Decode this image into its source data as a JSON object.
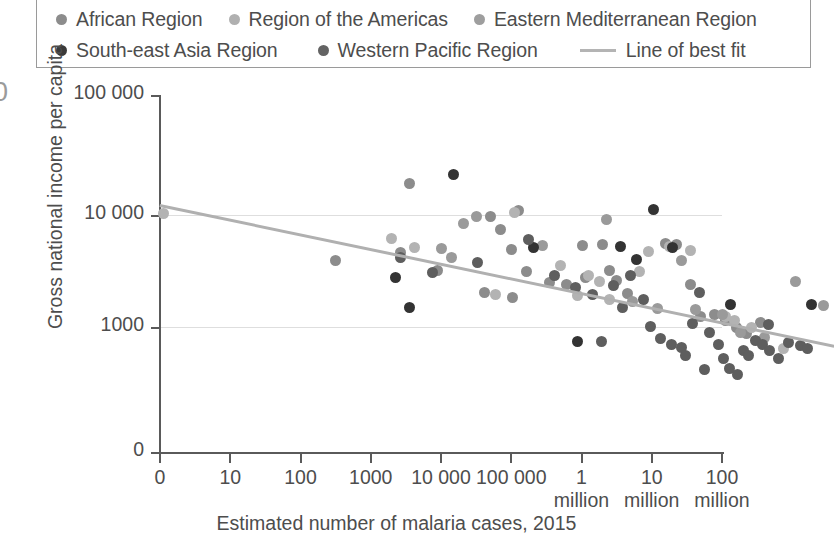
{
  "legend": {
    "rows": [
      [
        {
          "label": "African Region",
          "color": "#8c8c8c",
          "marker": "dot"
        },
        {
          "label": "Region of the Americas",
          "color": "#b0b0b0",
          "marker": "dot"
        },
        {
          "label": "Eastern Mediterranean Region",
          "color": "#9e9e9e",
          "marker": "dot"
        }
      ],
      [
        {
          "label": "South-east Asia Region",
          "color": "#3a3a3a",
          "marker": "dot"
        },
        {
          "label": "Western Pacific Region",
          "color": "#636363",
          "marker": "dot"
        },
        {
          "label": "Line of best fit",
          "color": "#b4b4b4",
          "marker": "line"
        }
      ]
    ]
  },
  "edge_glyph": "0",
  "chart_data": {
    "type": "scatter",
    "title": "",
    "xlabel": "Estimated number of malaria cases, 2015",
    "ylabel": "Gross national income per capita",
    "x_tick_labels": [
      "0",
      "10",
      "100",
      "1000",
      "10 000",
      "100 000",
      "1\nmillion",
      "10\nmillion",
      "100\nmillion"
    ],
    "y_tick_labels": [
      "100 000",
      "10 000",
      "1000",
      "0"
    ],
    "x_scale": "log-like ordinal decades",
    "y_scale": "log",
    "grid": "horizontal gridlines at 10 000 and 1000",
    "legend_position": "top",
    "xlim": [
      0,
      8
    ],
    "ylim": [
      0,
      100000
    ],
    "series": [
      {
        "name": "African Region",
        "color": "#8c8c8c",
        "points": [
          [
            2.5,
            3900
          ],
          [
            3.42,
            4600
          ],
          [
            3.55,
            19000
          ],
          [
            3.95,
            3200
          ],
          [
            4.7,
            9700
          ],
          [
            4.85,
            7400
          ],
          [
            5.1,
            11000
          ],
          [
            5.0,
            4900
          ],
          [
            5.22,
            3100
          ],
          [
            5.55,
            2500
          ],
          [
            4.62,
            2050
          ],
          [
            5.02,
            1850
          ],
          [
            6.02,
            5300
          ],
          [
            6.3,
            5450
          ],
          [
            6.4,
            3200
          ],
          [
            6.05,
            2750
          ],
          [
            6.5,
            2600
          ],
          [
            5.78,
            2400
          ],
          [
            6.65,
            2000
          ],
          [
            7.2,
            5600
          ],
          [
            7.35,
            5450
          ],
          [
            7.55,
            2400
          ],
          [
            7.7,
            1250
          ],
          [
            7.9,
            1300
          ],
          [
            8.05,
            1150
          ],
          [
            8.2,
            1000
          ],
          [
            8.35,
            880
          ],
          [
            8.55,
            1100
          ]
        ]
      },
      {
        "name": "Region of the Americas",
        "color": "#b3b3b3",
        "points": [
          [
            0.05,
            10400
          ],
          [
            5.05,
            10600
          ],
          [
            5.95,
            1900
          ],
          [
            6.4,
            1750
          ],
          [
            5.7,
            3550
          ],
          [
            6.1,
            2900
          ],
          [
            6.25,
            2550
          ],
          [
            7.25,
            5200
          ],
          [
            7.55,
            4800
          ],
          [
            6.95,
            4700
          ],
          [
            6.82,
            3100
          ],
          [
            8.05,
            1250
          ],
          [
            8.18,
            1150
          ],
          [
            8.42,
            980
          ],
          [
            8.88,
            640
          ],
          [
            4.78,
            1950
          ],
          [
            3.3,
            6200
          ],
          [
            3.62,
            5100
          ]
        ]
      },
      {
        "name": "Eastern Mediterranean Region",
        "color": "#9a9a9a",
        "points": [
          [
            4.5,
            9600
          ],
          [
            4.32,
            8400
          ],
          [
            5.45,
            5300
          ],
          [
            6.35,
            9100
          ],
          [
            6.72,
            1700
          ],
          [
            7.08,
            1450
          ],
          [
            7.42,
            3900
          ],
          [
            7.62,
            1420
          ],
          [
            8.0,
            1300
          ],
          [
            8.26,
            900
          ],
          [
            8.6,
            800
          ],
          [
            9.05,
            2550
          ],
          [
            9.45,
            1550
          ],
          [
            4.0,
            5000
          ],
          [
            4.15,
            4200
          ]
        ]
      },
      {
        "name": "South-east Asia Region",
        "color": "#333333",
        "points": [
          [
            3.35,
            2750
          ],
          [
            3.55,
            1500
          ],
          [
            4.18,
            23000
          ],
          [
            5.95,
            740
          ],
          [
            6.55,
            5200
          ],
          [
            7.02,
            11200
          ],
          [
            7.3,
            5100
          ],
          [
            8.12,
            1600
          ],
          [
            5.32,
            5100
          ],
          [
            6.78,
            4000
          ],
          [
            9.28,
            1600
          ]
        ]
      },
      {
        "name": "Western Pacific Region",
        "color": "#5e5e5e",
        "points": [
          [
            3.42,
            4150
          ],
          [
            3.88,
            3050
          ],
          [
            4.52,
            3800
          ],
          [
            5.25,
            6000
          ],
          [
            5.62,
            2900
          ],
          [
            5.92,
            2250
          ],
          [
            6.15,
            1950
          ],
          [
            6.45,
            2350
          ],
          [
            6.58,
            1480
          ],
          [
            6.88,
            1750
          ],
          [
            6.98,
            1020
          ],
          [
            7.12,
            790
          ],
          [
            7.28,
            700
          ],
          [
            7.42,
            660
          ],
          [
            7.48,
            560
          ],
          [
            7.68,
            2050
          ],
          [
            7.82,
            900
          ],
          [
            7.95,
            700
          ],
          [
            8.02,
            520
          ],
          [
            8.1,
            430
          ],
          [
            8.22,
            380
          ],
          [
            8.3,
            620
          ],
          [
            8.38,
            560
          ],
          [
            8.48,
            760
          ],
          [
            8.58,
            700
          ],
          [
            8.68,
            620
          ],
          [
            8.8,
            520
          ],
          [
            8.95,
            720
          ],
          [
            9.12,
            680
          ],
          [
            9.22,
            640
          ],
          [
            7.75,
            420
          ],
          [
            8.66,
            1060
          ],
          [
            7.58,
            1080
          ],
          [
            6.7,
            2900
          ],
          [
            6.28,
            740
          ]
        ]
      }
    ],
    "line_of_best_fit": {
      "label": "Line of best fit",
      "color": "#b0b0b0",
      "start": {
        "x": 0,
        "y": 12500
      },
      "end": {
        "x": 9.6,
        "y": 690
      }
    }
  }
}
